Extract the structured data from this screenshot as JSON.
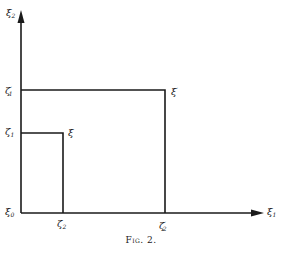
{
  "figure": {
    "caption": "Fig. 2.",
    "axes": {
      "vertical": {
        "label": "ξ",
        "subscript": "2"
      },
      "horizontal": {
        "label": "ξ",
        "subscript": "1"
      },
      "origin": {
        "label": "ξ",
        "subscript": "0"
      }
    },
    "y_ticks": [
      {
        "label": "ζ",
        "subscript": "1",
        "prime": "′",
        "id": "zeta1-prime"
      },
      {
        "label": "ζ",
        "subscript": "1",
        "prime": "",
        "id": "zeta1"
      }
    ],
    "x_ticks": [
      {
        "label": "ζ",
        "subscript": "2",
        "prime": "",
        "id": "zeta2"
      },
      {
        "label": "ζ",
        "subscript": "2",
        "prime": "′",
        "id": "zeta2-prime"
      }
    ],
    "points": [
      {
        "label": "ξ",
        "prime": "",
        "id": "xi"
      },
      {
        "label": "ξ",
        "prime": "′",
        "id": "xi-prime"
      }
    ],
    "colors": {
      "ink": "#1a1a1a",
      "background": "#ffffff"
    }
  }
}
